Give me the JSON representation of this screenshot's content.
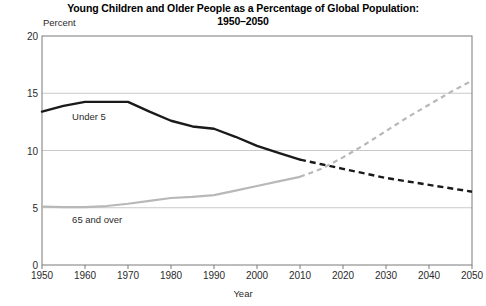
{
  "chart_data": {
    "type": "line",
    "title": "Young Children and Older People as a Percentage of Global Population:",
    "title_line2": "1950–2050",
    "xlabel": "Year",
    "ylabel": "Percent",
    "ylim": [
      0,
      20
    ],
    "xlim": [
      1950,
      2050
    ],
    "grid": "horizontal",
    "legend": "inline-labels",
    "yticks": [
      0,
      5,
      10,
      15,
      20
    ],
    "xticks": [
      1950,
      1960,
      1970,
      1980,
      1990,
      2000,
      2010,
      2020,
      2030,
      2040,
      2050
    ],
    "projection_start_year": 2010,
    "series": [
      {
        "name": "Under 5",
        "color": "#1a1a1a",
        "x": [
          1950,
          1955,
          1960,
          1965,
          1970,
          1975,
          1980,
          1985,
          1990,
          1995,
          2000,
          2005,
          2010,
          2015,
          2020,
          2025,
          2030,
          2035,
          2040,
          2045,
          2050
        ],
        "values": [
          13.4,
          13.9,
          14.25,
          14.25,
          14.25,
          13.4,
          12.6,
          12.1,
          11.9,
          11.2,
          10.4,
          9.8,
          9.2,
          8.8,
          8.4,
          8.0,
          7.6,
          7.3,
          7.0,
          6.7,
          6.4
        ]
      },
      {
        "name": "65 and over",
        "color": "#b8b8b8",
        "x": [
          1950,
          1955,
          1960,
          1965,
          1970,
          1975,
          1980,
          1985,
          1990,
          1995,
          2000,
          2005,
          2010,
          2015,
          2020,
          2025,
          2030,
          2035,
          2040,
          2045,
          2050
        ],
        "values": [
          5.1,
          5.05,
          5.05,
          5.15,
          5.35,
          5.6,
          5.85,
          5.95,
          6.1,
          6.5,
          6.9,
          7.3,
          7.7,
          8.4,
          9.4,
          10.5,
          11.7,
          12.9,
          14.0,
          15.1,
          16.1
        ]
      }
    ],
    "annotations": [
      {
        "text": "Under 5",
        "year": 1957,
        "value": 12.9
      },
      {
        "text": "65 and over",
        "year": 1957,
        "value": 3.9
      }
    ]
  },
  "plot_area": {
    "left": 42,
    "right": 472,
    "top": 36,
    "bottom": 265,
    "frame_color": "#7a7a7a",
    "grid_color": "#c9c9c9"
  }
}
